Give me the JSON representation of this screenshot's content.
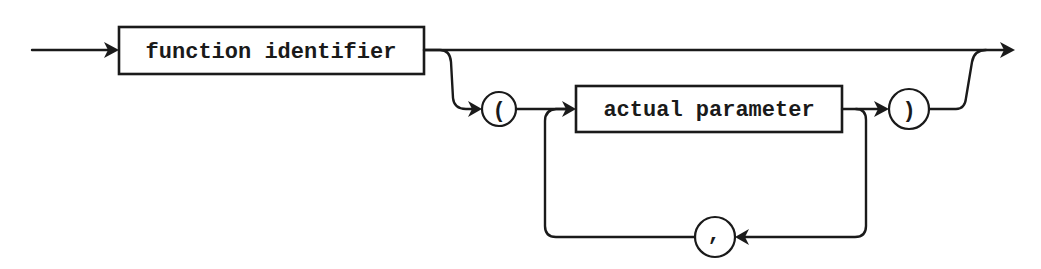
{
  "diagram": {
    "type": "syntax-railroad-diagram",
    "nodes": {
      "function_identifier": {
        "label": "function identifier",
        "kind": "nonterminal"
      },
      "open_paren": {
        "label": "(",
        "kind": "terminal"
      },
      "actual_parameter": {
        "label": "actual parameter",
        "kind": "nonterminal"
      },
      "close_paren": {
        "label": ")",
        "kind": "terminal"
      },
      "comma": {
        "label": ",",
        "kind": "terminal"
      }
    },
    "edges": [
      {
        "from": "start",
        "to": "function_identifier"
      },
      {
        "from": "function_identifier",
        "to": "end",
        "note": "bypass (no parameters)"
      },
      {
        "from": "function_identifier",
        "to": "open_paren"
      },
      {
        "from": "open_paren",
        "to": "actual_parameter"
      },
      {
        "from": "actual_parameter",
        "to": "close_paren"
      },
      {
        "from": "actual_parameter",
        "to": "comma",
        "note": "loop back"
      },
      {
        "from": "comma",
        "to": "actual_parameter"
      },
      {
        "from": "close_paren",
        "to": "end"
      }
    ],
    "colors": {
      "ink": "#1a1a1a",
      "background": "#ffffff"
    }
  }
}
